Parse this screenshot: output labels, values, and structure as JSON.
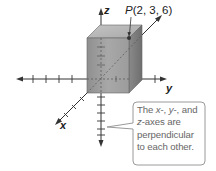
{
  "figure": {
    "point": {
      "name": "P",
      "coords": "(2, 3, 6)",
      "x": 2,
      "y": 3,
      "z": 6
    },
    "axes": {
      "x_label": "x",
      "y_label": "y",
      "z_label": "z"
    },
    "callout": {
      "line1_var1": "x",
      "line1_sep1": "-, ",
      "line1_var2": "y",
      "line1_sep2": "-, and",
      "line2_var": "z",
      "line2_rest": "-axes are",
      "line3": "perpendicular",
      "line4": "to each other."
    },
    "colors": {
      "box_front": "#9a9a9a",
      "box_top": "#b8b8b8",
      "box_side": "#7d7d7d",
      "axis": "#333333",
      "callout_border": "#999999",
      "callout_text": "#666666"
    }
  }
}
